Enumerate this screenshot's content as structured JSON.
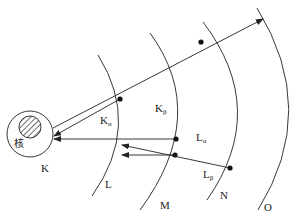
{
  "diagram": {
    "nucleus_label": "核",
    "shells": [
      {
        "id": "K",
        "label": "K"
      },
      {
        "id": "L",
        "label": "L"
      },
      {
        "id": "M",
        "label": "M"
      },
      {
        "id": "N",
        "label": "N"
      },
      {
        "id": "O",
        "label": "O"
      }
    ],
    "transitions": [
      {
        "label": "K",
        "subscript": "α",
        "from": "L",
        "to": "K"
      },
      {
        "label": "K",
        "subscript": "β",
        "from": "M",
        "to": "K"
      },
      {
        "label": "L",
        "subscript": "α",
        "from": "M",
        "to": "L"
      },
      {
        "label": "L",
        "subscript": "β",
        "from": "N",
        "to": "L"
      }
    ],
    "colors": {
      "line": "#222222",
      "background": "#ffffff"
    }
  }
}
